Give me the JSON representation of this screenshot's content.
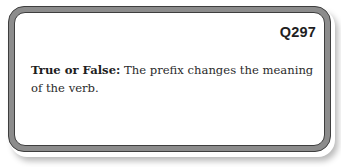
{
  "card": {
    "question_number": "Q297",
    "lead_label": "True or False:",
    "question_text": " The prefix changes the meaning of the verb.",
    "colors": {
      "frame_fill": "#8c8c8c",
      "frame_edge": "#3e3e3e",
      "card_background": "#ffffff",
      "text": "#2a2a2a"
    }
  }
}
